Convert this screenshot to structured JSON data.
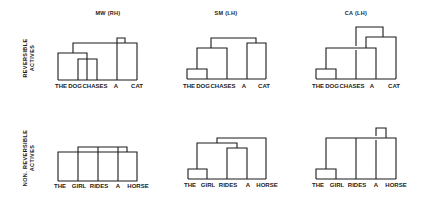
{
  "columns": [
    {
      "label": "MW (RH)",
      "x": 108
    },
    {
      "label": "SM (LH)",
      "x": 226
    },
    {
      "label": "CA (LH)",
      "x": 356
    }
  ],
  "rows": [
    {
      "label_line1": "REVERSIBLE",
      "label_line2": "ACTIVES",
      "cx": 29,
      "cy": 58
    },
    {
      "label_line1": "NON. REVERSIBLE",
      "label_line2": "ACTIVES",
      "cx": 29,
      "cy": 158
    }
  ],
  "panels": [
    {
      "id": "reversible-mw",
      "words": [
        {
          "text": "THE",
          "x": 61
        },
        {
          "text": "DOG",
          "x": 75
        },
        {
          "text": "CHASES",
          "x": 95
        },
        {
          "text": "A",
          "x": 116
        },
        {
          "text": "CAT",
          "x": 137
        }
      ],
      "word_y": 86,
      "path": "M58 80 H137 M58 80 V53 H87 V80 M78 80 V59 H97 V80 M73 53 V43 H137 V80 M117 80 V38 H125 V43"
    },
    {
      "id": "reversible-sm",
      "words": [
        {
          "text": "THE",
          "x": 189
        },
        {
          "text": "DOG",
          "x": 203
        },
        {
          "text": "CHASES",
          "x": 223
        },
        {
          "text": "A",
          "x": 244
        },
        {
          "text": "CAT",
          "x": 264
        }
      ],
      "word_y": 86,
      "path": "M187 79 H266 M187 79 V69 H207 V79 M197 69 V48 H227 V79 M211 48 V38 H256 V43 M247 79 V43 H266 V79"
    },
    {
      "id": "reversible-ca",
      "words": [
        {
          "text": "THE",
          "x": 318
        },
        {
          "text": "DOG",
          "x": 332
        },
        {
          "text": "CHASES",
          "x": 352
        },
        {
          "text": "A",
          "x": 372
        },
        {
          "text": "CAT",
          "x": 394
        }
      ],
      "word_y": 86,
      "path": "M316 79 H396 M316 79 V69 H336 V79 M326 69 V48 H376 V79 M356 79 V50 M356 46 V27 H383 V37 M366 48 V37 H396 V79"
    },
    {
      "id": "nonreversible-mw",
      "words": [
        {
          "text": "THE",
          "x": 60
        },
        {
          "text": "GIRL",
          "x": 79
        },
        {
          "text": "RIDES",
          "x": 99
        },
        {
          "text": "A",
          "x": 118
        },
        {
          "text": "HORSE",
          "x": 138
        }
      ],
      "word_y": 186,
      "path": "M58 181 H137 V152 H58 V181 M78 181 V147 H127 V152 M98 181 V147 M118 181 V147"
    },
    {
      "id": "nonreversible-sm",
      "words": [
        {
          "text": "THE",
          "x": 190
        },
        {
          "text": "GIRL",
          "x": 208
        },
        {
          "text": "RIDES",
          "x": 228
        },
        {
          "text": "A",
          "x": 248
        },
        {
          "text": "HORSE",
          "x": 267
        }
      ],
      "word_y": 185,
      "path": "M188 179 H266 M188 179 V169 H207 V179 M197 169 V143 H237 V148 M227 179 V148 H247 V179 M217 143 V138 H266 V179"
    },
    {
      "id": "nonreversible-ca",
      "words": [
        {
          "text": "THE",
          "x": 318
        },
        {
          "text": "GIRL",
          "x": 337
        },
        {
          "text": "RIDES",
          "x": 357
        },
        {
          "text": "A",
          "x": 376
        },
        {
          "text": "HORSE",
          "x": 396
        }
      ],
      "word_y": 185,
      "path": "M316 179 H396 M316 179 V169 H336 V179 M326 169 V138 H396 V179 M356 179 V138 M376 179 V140 M376 136 V128 H386 V138"
    }
  ]
}
